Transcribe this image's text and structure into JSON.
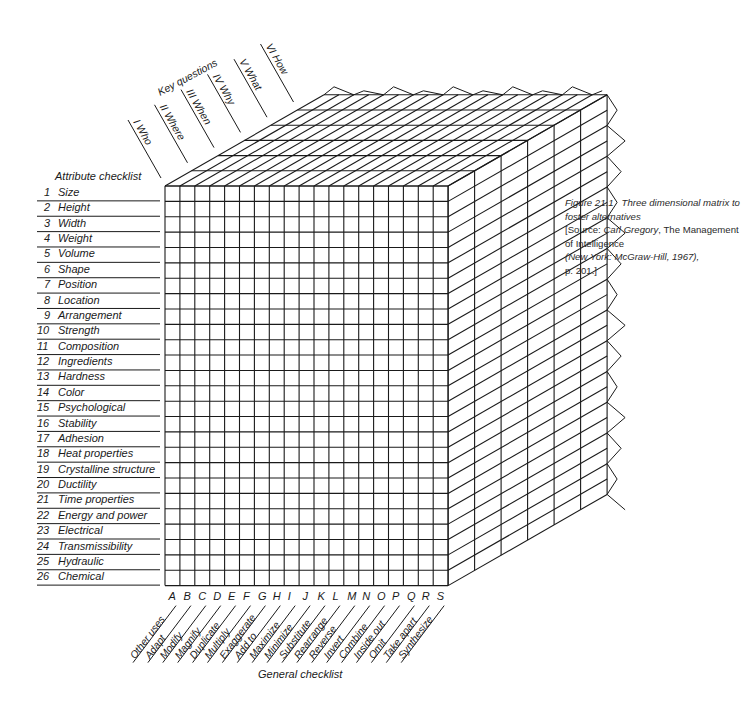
{
  "figure": {
    "caption": {
      "number": "Figure 21.1",
      "title": "Three dimensional matrix to foster alternatives",
      "source_prefix": "[Source:",
      "author": "Carl Gregory",
      "book": ", The Management of Intelligence",
      "publisher": "(New York: McGraw-Hill, 1967),",
      "page": "p. 201.]"
    },
    "key_questions": {
      "title": "Key questions",
      "items": [
        "I   Who",
        "II   Where",
        "III   When",
        "IV   Why",
        "V   What",
        "VI   How"
      ]
    },
    "attribute_checklist": {
      "title": "Attribute checklist",
      "items": [
        "1  Size",
        "2  Height",
        "3  Width",
        "4  Weight",
        "5  Volume",
        "6  Shape",
        "7  Position",
        "8  Location",
        "9  Arrangement",
        "10  Strength",
        "11  Composition",
        "12  Ingredients",
        "13  Hardness",
        "14  Color",
        "15  Psychological",
        "16  Stability",
        "17  Adhesion",
        "18  Heat properties",
        "19  Crystalline structure",
        "20  Ductility",
        "21  Time properties",
        "22  Energy and power",
        "23  Electrical",
        "24  Transmissibility",
        "25  Hydraulic",
        "26  Chemical"
      ]
    },
    "general_checklist": {
      "title": "General checklist",
      "letters": [
        "A",
        "B",
        "C",
        "D",
        "E",
        "F",
        "G",
        "H",
        "I",
        "J",
        "K",
        "L",
        "M",
        "N",
        "O",
        "P",
        "Q",
        "R",
        "S"
      ],
      "items": [
        "Other uses",
        "Adapt",
        "Modify",
        "Magnify",
        "Duplicate",
        "Multiply",
        "Exaggerate",
        "Add to",
        "Maximize",
        "Minimize",
        "Substitute",
        "Rearrange",
        "Reverse",
        "Invert",
        "Combine",
        "Inside out",
        "Omit",
        "Take apart",
        "Synthesize"
      ]
    },
    "colors": {
      "ink": "#1a1a1a",
      "paper": "#ffffff"
    }
  }
}
